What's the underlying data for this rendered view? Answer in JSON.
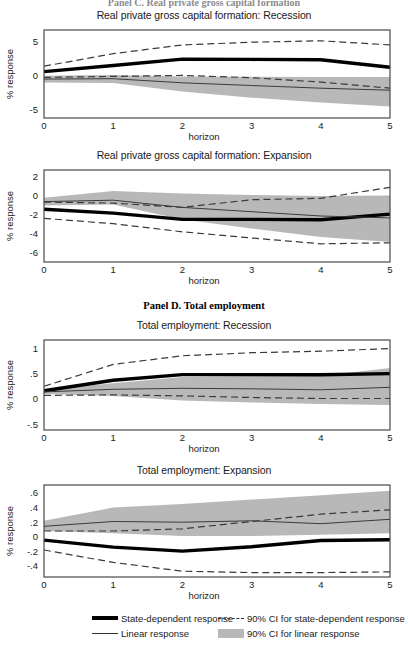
{
  "figure": {
    "panel_c_header": "Panel C. Real private gross capital formation",
    "panel_d_header": "Panel D. Total employment"
  },
  "legend": {
    "items": [
      {
        "key": "state-dependent-response",
        "label": "State-dependent response",
        "style": "thick-solid",
        "color": "#000000"
      },
      {
        "key": "linear-response",
        "label": "Linear response",
        "style": "thin-solid",
        "color": "#333333"
      },
      {
        "key": "ci-state-dependent",
        "label": "90% CI for state-dependent response",
        "style": "dashed",
        "color": "#333333"
      },
      {
        "key": "ci-linear",
        "label": "90% CI for linear response",
        "style": "band",
        "color": "#b8b8b8"
      }
    ]
  },
  "chart_data": [
    {
      "id": "capital-recession",
      "type": "line",
      "title": "Real private gross capital formation: Recession",
      "xlabel": "horizon",
      "ylabel": "% response",
      "x": [
        0,
        1,
        2,
        3,
        4,
        5
      ],
      "xlim": [
        0,
        5
      ],
      "ylim": [
        -6.4,
        6.6
      ],
      "xticks": [
        0,
        1,
        2,
        3,
        4,
        5
      ],
      "xticklabels": [
        "0",
        "1",
        "2",
        "3",
        "4",
        "5"
      ],
      "yticks": [
        5,
        0,
        -5
      ],
      "yticklabels": [
        "5",
        "0",
        "-5"
      ],
      "grid": false,
      "series": [
        {
          "name": "State-dependent response",
          "style": "thick-solid",
          "values": [
            0.45,
            1.35,
            2.3,
            2.25,
            2.2,
            1.1
          ]
        },
        {
          "name": "Linear response",
          "style": "thin-solid",
          "values": [
            -0.65,
            -0.6,
            -1.2,
            -1.6,
            -2.0,
            -2.3
          ]
        },
        {
          "name": "90% CI for state-dependent response upper",
          "style": "dashed",
          "values": [
            1.25,
            3.1,
            4.4,
            4.8,
            5.0,
            4.4
          ]
        },
        {
          "name": "90% CI for state-dependent response lower",
          "style": "dashed",
          "values": [
            -0.4,
            -0.25,
            -0.1,
            -0.45,
            -1.1,
            -2.0
          ]
        }
      ],
      "band": {
        "name": "90% CI for linear response",
        "lower": [
          -1.15,
          -1.25,
          -2.5,
          -3.4,
          -4.1,
          -4.7
        ],
        "upper": [
          -0.15,
          -0.05,
          -0.25,
          -0.3,
          -0.35,
          -0.35
        ]
      }
    },
    {
      "id": "capital-expansion",
      "type": "line",
      "title": "Real private gross capital formation: Expansion",
      "xlabel": "horizon",
      "ylabel": "% response",
      "x": [
        0,
        1,
        2,
        3,
        4,
        5
      ],
      "xlim": [
        0,
        5
      ],
      "ylim": [
        -7.0,
        2.6
      ],
      "xticks": [
        0,
        1,
        2,
        3,
        4,
        5
      ],
      "xticklabels": [
        "0",
        "1",
        "2",
        "3",
        "4",
        "5"
      ],
      "yticks": [
        2,
        0,
        -2,
        -4,
        -6
      ],
      "yticklabels": [
        "2",
        "0",
        "-2",
        "-4",
        "-6"
      ],
      "grid": false,
      "series": [
        {
          "name": "State-dependent response",
          "style": "thick-solid",
          "values": [
            -1.5,
            -1.9,
            -2.55,
            -2.55,
            -2.6,
            -2.0
          ]
        },
        {
          "name": "Linear response",
          "style": "thin-solid",
          "values": [
            -0.7,
            -0.55,
            -1.3,
            -1.75,
            -2.2,
            -2.4
          ]
        },
        {
          "name": "90% CI for state-dependent response upper",
          "style": "dashed",
          "values": [
            -0.75,
            -0.85,
            -1.3,
            -0.5,
            -0.35,
            0.8
          ]
        },
        {
          "name": "90% CI for state-dependent response lower",
          "style": "dashed",
          "values": [
            -2.45,
            -3.0,
            -3.85,
            -4.5,
            -5.1,
            -5.0
          ]
        }
      ],
      "band": {
        "name": "90% CI for linear response",
        "lower": [
          -1.1,
          -1.0,
          -2.55,
          -3.5,
          -4.4,
          -4.9
        ],
        "upper": [
          -0.3,
          0.4,
          0.15,
          0.0,
          -0.1,
          -0.05
        ]
      }
    },
    {
      "id": "employment-recession",
      "type": "line",
      "title": "Total employment: Recession",
      "xlabel": "horizon",
      "ylabel": "% response",
      "x": [
        0,
        1,
        2,
        3,
        4,
        5
      ],
      "xlim": [
        0,
        5
      ],
      "ylim": [
        -0.62,
        1.15
      ],
      "xticks": [
        0,
        1,
        2,
        3,
        4,
        5
      ],
      "xticklabels": [
        "0",
        "1",
        "2",
        "3",
        "4",
        "5"
      ],
      "yticks": [
        1,
        0.5,
        0,
        -0.5
      ],
      "yticklabels": [
        "1",
        ".5",
        "0",
        "-.5"
      ],
      "grid": false,
      "series": [
        {
          "name": "State-dependent response",
          "style": "thick-solid",
          "values": [
            0.15,
            0.36,
            0.47,
            0.47,
            0.465,
            0.49
          ]
        },
        {
          "name": "Linear response",
          "style": "thin-solid",
          "values": [
            0.13,
            0.18,
            0.2,
            0.19,
            0.17,
            0.22
          ]
        },
        {
          "name": "90% CI for state-dependent response upper",
          "style": "dashed",
          "values": [
            0.24,
            0.67,
            0.84,
            0.9,
            0.93,
            0.98
          ]
        },
        {
          "name": "90% CI for state-dependent response lower",
          "style": "dashed",
          "values": [
            0.06,
            0.07,
            0.05,
            0.02,
            0.0,
            0.0
          ]
        }
      ],
      "band": {
        "name": "90% CI for linear response",
        "lower": [
          0.09,
          0.05,
          -0.04,
          -0.08,
          -0.11,
          -0.13
        ],
        "upper": [
          0.18,
          0.3,
          0.42,
          0.44,
          0.44,
          0.6
        ]
      }
    },
    {
      "id": "employment-expansion",
      "type": "line",
      "title": "Total employment: Expansion",
      "xlabel": "horizon",
      "ylabel": "% response",
      "x": [
        0,
        1,
        2,
        3,
        4,
        5
      ],
      "xlim": [
        0,
        5
      ],
      "ylim": [
        -0.56,
        0.7
      ],
      "xticks": [
        0,
        1,
        2,
        3,
        4,
        5
      ],
      "xticklabels": [
        "0",
        "1",
        "2",
        "3",
        "4",
        "5"
      ],
      "yticks": [
        0.6,
        0.4,
        0.2,
        0,
        -0.2,
        -0.4
      ],
      "yticklabels": [
        ".6",
        ".4",
        ".2",
        "0",
        "-.2",
        "-.4"
      ],
      "grid": false,
      "series": [
        {
          "name": "State-dependent response",
          "style": "thick-solid",
          "values": [
            -0.055,
            -0.15,
            -0.205,
            -0.145,
            -0.06,
            -0.05
          ]
        },
        {
          "name": "Linear response",
          "style": "thin-solid",
          "values": [
            0.135,
            0.2,
            0.19,
            0.21,
            0.17,
            0.23
          ]
        },
        {
          "name": "90% CI for state-dependent response upper",
          "style": "dashed",
          "values": [
            0.07,
            0.07,
            0.1,
            0.2,
            0.3,
            0.36
          ]
        },
        {
          "name": "90% CI for state-dependent response lower",
          "style": "dashed",
          "values": [
            -0.19,
            -0.36,
            -0.48,
            -0.5,
            -0.5,
            -0.49
          ]
        }
      ],
      "band": {
        "name": "90% CI for linear response",
        "lower": [
          0.07,
          0.04,
          0.0,
          0.0,
          0.02,
          0.04
        ],
        "upper": [
          0.21,
          0.39,
          0.44,
          0.5,
          0.56,
          0.62
        ]
      }
    }
  ]
}
